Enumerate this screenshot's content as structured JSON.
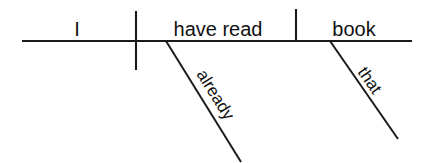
{
  "diagram": {
    "type": "reed-kellogg-sentence-diagram",
    "sentence": "I have read that book already.",
    "colors": {
      "background": "#ffffff",
      "line": "#1b1b1b",
      "text": "#111111"
    },
    "baseline": {
      "name": "main-horizontal-baseline",
      "x1": 22,
      "y1": 41,
      "x2": 412,
      "y2": 41
    },
    "dividers": [
      {
        "name": "subject-verb-divider",
        "role": "subject-predicate separator",
        "x": 136,
        "y1": 11,
        "y2": 70
      },
      {
        "name": "verb-object-divider",
        "role": "verb direct-object separator",
        "x": 296,
        "y1": 9,
        "y2": 42
      }
    ],
    "words": [
      {
        "label": "I",
        "role": "subject",
        "slot": "subject-slot",
        "x": 77,
        "y": 36,
        "anchor": "middle"
      },
      {
        "label": "have read",
        "role": "verb",
        "slot": "verb-slot",
        "x": 218,
        "y": 36,
        "anchor": "middle"
      },
      {
        "label": "book",
        "role": "direct-object",
        "slot": "direct-object-slot",
        "x": 354,
        "y": 36,
        "anchor": "middle"
      }
    ],
    "modifiers": [
      {
        "label": "already",
        "role": "adverb modifying verb",
        "slot": "adverb-slant-already",
        "line": {
          "x1": 166,
          "y1": 41,
          "x2": 241,
          "y2": 162
        },
        "text": {
          "x": 196,
          "y": 74,
          "rotate": 58
        }
      },
      {
        "label": "that",
        "role": "adjective modifying direct object",
        "slot": "adjective-slant-that",
        "line": {
          "x1": 330,
          "y1": 41,
          "x2": 398,
          "y2": 139
        },
        "text": {
          "x": 357,
          "y": 72,
          "rotate": 55
        }
      }
    ]
  }
}
